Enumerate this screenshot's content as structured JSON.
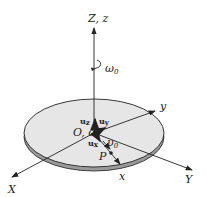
{
  "diagram": {
    "axes": {
      "Z": "Z, z",
      "X": "X",
      "Y": "Y",
      "x": "x",
      "y": "y"
    },
    "origin": "O, o",
    "angular_velocity": "ω",
    "angular_velocity_sub": "0",
    "velocity": "υ",
    "velocity_sub": "0",
    "point": "P",
    "unit_vectors": {
      "uz": "u",
      "uz_sub": "z",
      "uy": "u",
      "uy_sub": "y",
      "ux": "u",
      "ux_sub": "x"
    },
    "colors": {
      "disk_fill": "#e4e4e4",
      "disk_edge": "#7a7a7a",
      "line": "#222222"
    }
  }
}
